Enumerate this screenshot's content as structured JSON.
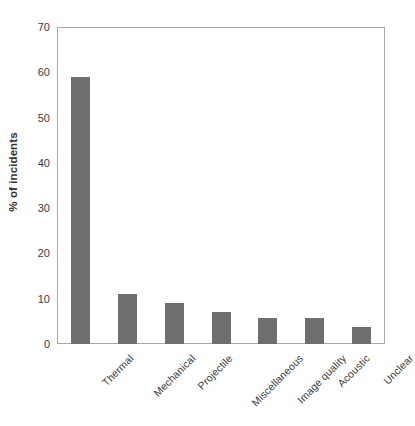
{
  "chart_data": {
    "type": "bar",
    "title": "",
    "subtitle": "",
    "xlabel": "",
    "ylabel": "% of incidents",
    "categories": [
      "Thermal",
      "Mechanical",
      "Projectile",
      "Miscellaneous",
      "Image quality",
      "Acoustic",
      "Unclear"
    ],
    "values": [
      59,
      11,
      9,
      7,
      5.8,
      5.8,
      3.8
    ],
    "ylim": [
      0,
      70
    ],
    "yticks": [
      0,
      10,
      20,
      30,
      40,
      50,
      60,
      70
    ],
    "ytick_labels": [
      "0",
      "10",
      "20",
      "30",
      "40",
      "50",
      "60",
      "70"
    ],
    "grid": false,
    "legend": null,
    "series": [
      {
        "name": "% of incidents",
        "values": [
          59,
          11,
          9,
          7,
          5.8,
          5.8,
          3.8
        ]
      }
    ],
    "colors": {
      "bar": "#6e6e6e",
      "axis": "#a8a8a8",
      "text": "#3c3c3c",
      "background": "#ffffff"
    }
  }
}
